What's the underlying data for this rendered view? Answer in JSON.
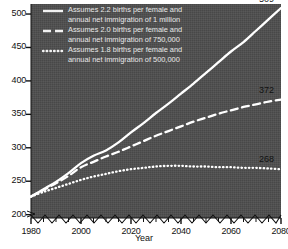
{
  "chart_data": {
    "type": "line",
    "title": "",
    "xlabel": "Year",
    "ylabel": "",
    "xlim": [
      1980,
      2080
    ],
    "ylim": [
      195,
      515
    ],
    "y_axis_break": true,
    "grid": false,
    "legend_position": "top-left",
    "xticks": [
      1980,
      2000,
      2020,
      2040,
      2060,
      2080
    ],
    "xticks_minor_step": 5,
    "yticks": [
      200,
      250,
      300,
      350,
      400,
      450,
      500
    ],
    "series": [
      {
        "name": "Assumes 2.2 births per female and annual net immigration of 1 million",
        "style": "solid",
        "end_label": "509",
        "x": [
          1980,
          1985,
          1990,
          1995,
          2000,
          2005,
          2010,
          2015,
          2020,
          2025,
          2030,
          2035,
          2040,
          2045,
          2050,
          2055,
          2060,
          2065,
          2070,
          2075,
          2080
        ],
        "values": [
          227,
          238,
          249,
          262,
          277,
          288,
          296,
          308,
          323,
          337,
          352,
          366,
          381,
          396,
          412,
          428,
          444,
          458,
          475,
          492,
          509
        ]
      },
      {
        "name": "Assumes 2.0 births per female and annual net immigration of 750,000",
        "style": "dashed",
        "end_label": "372",
        "x": [
          1980,
          1985,
          1990,
          1995,
          2000,
          2005,
          2010,
          2015,
          2020,
          2025,
          2030,
          2035,
          2040,
          2045,
          2050,
          2055,
          2060,
          2065,
          2070,
          2075,
          2080
        ],
        "values": [
          227,
          237,
          247,
          258,
          271,
          279,
          287,
          294,
          302,
          310,
          318,
          325,
          332,
          339,
          345,
          351,
          356,
          361,
          365,
          369,
          372
        ]
      },
      {
        "name": "Assumes 1.8 births per female and annual net immigration of 500,000",
        "style": "dotted",
        "end_label": "268",
        "x": [
          1980,
          1985,
          1990,
          1995,
          2000,
          2005,
          2010,
          2015,
          2020,
          2025,
          2030,
          2035,
          2040,
          2045,
          2050,
          2055,
          2060,
          2065,
          2070,
          2075,
          2080
        ],
        "values": [
          227,
          234,
          240,
          246,
          252,
          257,
          261,
          265,
          268,
          270,
          272,
          273,
          273,
          272,
          272,
          271,
          271,
          270,
          270,
          269,
          268
        ]
      }
    ],
    "colors": {
      "plot_background": "#4d4d4d",
      "line": "#ffffff",
      "page_background": "#ffffff",
      "axis_text": "#111111",
      "legend_text": "#e8e8e8"
    }
  },
  "axis": {
    "y_tick_labels": [
      "500",
      "450",
      "400",
      "350",
      "300",
      "250",
      "200"
    ],
    "x_tick_labels": [
      "1980",
      "2000",
      "2020",
      "2040",
      "2060",
      "2080"
    ],
    "x_title": "Year"
  },
  "legend": {
    "entries": [
      {
        "line1": "Assumes 2.2 births per female and",
        "line2": "annual net immigration of 1 million",
        "swatch": "solid-line-swatch"
      },
      {
        "line1": "Assumes 2.0 births per female and",
        "line2": "annual net immigration of 750,000",
        "swatch": "dashed-line-swatch"
      },
      {
        "line1": "Assumes 1.8 births per female and",
        "line2": "annual net immigration of 500,000",
        "swatch": "dotted-line-swatch"
      }
    ]
  },
  "end_labels": {
    "solid": "509",
    "dashed": "372",
    "dotted": "268"
  }
}
